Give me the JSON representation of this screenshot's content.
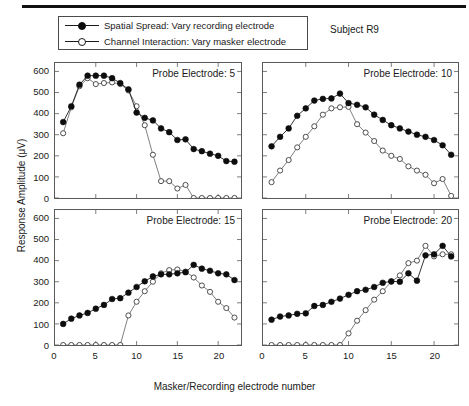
{
  "figure": {
    "subject": "Subject R9",
    "xlabel": "Masker/Recording electrode number",
    "ylabel": "Response Amplitude (μV)"
  },
  "legend": {
    "items": [
      {
        "marker": "filled-circle",
        "label": "Spatial Spread: Vary recording electrode"
      },
      {
        "marker": "open-circle",
        "label": "Channel Interaction: Vary masker electrode"
      }
    ]
  },
  "chart_data": [
    {
      "type": "line",
      "title": "Probe Electrode: 5",
      "panel": "top-left",
      "xlabel": "Masker/Recording electrode number",
      "ylabel": "Response Amplitude (μV)",
      "xlim": [
        0,
        22.8
      ],
      "ylim": [
        0,
        640
      ],
      "xticks": [
        0,
        5,
        10,
        15,
        20
      ],
      "yticks": [
        0,
        100,
        200,
        300,
        400,
        500,
        600
      ],
      "ytick_labels_shown": true,
      "xtick_labels_shown": false,
      "grid": false,
      "x": [
        1,
        2,
        3,
        4,
        5,
        6,
        7,
        8,
        9,
        10,
        11,
        12,
        13,
        14,
        15,
        16,
        17,
        18,
        19,
        20,
        21,
        22
      ],
      "series": [
        {
          "name": "Spatial Spread: Vary recording electrode",
          "marker": "filled-circle",
          "values": [
            360,
            435,
            537,
            580,
            580,
            580,
            568,
            545,
            515,
            405,
            380,
            368,
            330,
            312,
            275,
            278,
            232,
            222,
            210,
            200,
            175,
            172
          ]
        },
        {
          "name": "Channel Interaction: Vary masker electrode",
          "marker": "open-circle",
          "values": [
            307,
            430,
            530,
            568,
            540,
            545,
            548,
            540,
            510,
            435,
            345,
            205,
            80,
            80,
            45,
            62,
            0,
            0,
            0,
            0,
            0,
            0
          ]
        }
      ]
    },
    {
      "type": "line",
      "title": "Probe Electrode: 10",
      "panel": "top-right",
      "xlabel": "Masker/Recording electrode number",
      "ylabel": "Response Amplitude (μV)",
      "xlim": [
        0,
        22.8
      ],
      "ylim": [
        0,
        640
      ],
      "xticks": [
        0,
        5,
        10,
        15,
        20
      ],
      "yticks": [
        0,
        100,
        200,
        300,
        400,
        500,
        600
      ],
      "ytick_labels_shown": false,
      "xtick_labels_shown": false,
      "grid": false,
      "x": [
        1,
        2,
        3,
        4,
        5,
        6,
        7,
        8,
        9,
        10,
        11,
        12,
        13,
        14,
        15,
        16,
        17,
        18,
        19,
        20,
        21,
        22
      ],
      "series": [
        {
          "name": "Spatial Spread: Vary recording electrode",
          "marker": "filled-circle",
          "values": [
            245,
            290,
            330,
            390,
            425,
            462,
            470,
            472,
            495,
            450,
            442,
            430,
            395,
            370,
            345,
            330,
            315,
            300,
            290,
            275,
            250,
            205
          ]
        },
        {
          "name": "Channel Interaction: Vary masker electrode",
          "marker": "open-circle",
          "values": [
            75,
            130,
            180,
            240,
            290,
            340,
            395,
            425,
            430,
            432,
            350,
            310,
            270,
            225,
            200,
            185,
            150,
            130,
            110,
            70,
            90,
            10
          ]
        }
      ]
    },
    {
      "type": "line",
      "title": "Probe Electrode: 15",
      "panel": "bottom-left",
      "xlabel": "Masker/Recording electrode number",
      "ylabel": "Response Amplitude (μV)",
      "xlim": [
        0,
        22.8
      ],
      "ylim": [
        0,
        640
      ],
      "xticks": [
        0,
        5,
        10,
        15,
        20
      ],
      "yticks": [
        0,
        100,
        200,
        300,
        400,
        500,
        600
      ],
      "ytick_labels_shown": true,
      "xtick_labels_shown": true,
      "grid": false,
      "x": [
        1,
        2,
        3,
        4,
        5,
        6,
        7,
        8,
        9,
        10,
        11,
        12,
        13,
        14,
        15,
        16,
        17,
        18,
        19,
        20,
        21,
        22
      ],
      "series": [
        {
          "name": "Spatial Spread: Vary recording electrode",
          "marker": "filled-circle",
          "values": [
            100,
            125,
            140,
            152,
            172,
            190,
            218,
            222,
            248,
            275,
            302,
            325,
            335,
            335,
            340,
            345,
            380,
            362,
            352,
            340,
            335,
            308
          ]
        },
        {
          "name": "Channel Interaction: Vary masker electrode",
          "marker": "open-circle",
          "values": [
            0,
            0,
            0,
            0,
            0,
            0,
            0,
            0,
            140,
            205,
            255,
            300,
            340,
            355,
            358,
            348,
            320,
            282,
            252,
            205,
            175,
            130
          ]
        }
      ]
    },
    {
      "type": "line",
      "title": "Probe Electrode: 20",
      "panel": "bottom-right",
      "xlabel": "Masker/Recording electrode number",
      "ylabel": "Response Amplitude (μV)",
      "xlim": [
        0,
        22.8
      ],
      "ylim": [
        0,
        640
      ],
      "xticks": [
        0,
        5,
        10,
        15,
        20
      ],
      "yticks": [
        0,
        100,
        200,
        300,
        400,
        500,
        600
      ],
      "ytick_labels_shown": false,
      "xtick_labels_shown": true,
      "grid": false,
      "x": [
        1,
        2,
        3,
        4,
        5,
        6,
        7,
        8,
        9,
        10,
        11,
        12,
        13,
        14,
        15,
        16,
        17,
        18,
        19,
        20,
        21,
        22
      ],
      "series": [
        {
          "name": "Spatial Spread: Vary recording electrode",
          "marker": "filled-circle",
          "values": [
            120,
            135,
            140,
            148,
            150,
            185,
            190,
            205,
            220,
            238,
            255,
            262,
            275,
            295,
            302,
            300,
            340,
            305,
            425,
            430,
            470,
            420
          ]
        },
        {
          "name": "Channel Interaction: Vary masker electrode",
          "marker": "open-circle",
          "values": [
            0,
            0,
            0,
            0,
            0,
            0,
            0,
            0,
            0,
            55,
            115,
            165,
            215,
            255,
            300,
            330,
            388,
            400,
            470,
            420,
            430,
            430
          ]
        }
      ]
    }
  ],
  "panels": [
    {
      "id": "top-left",
      "title": "Probe Electrode: 5"
    },
    {
      "id": "top-right",
      "title": "Probe Electrode: 10"
    },
    {
      "id": "bottom-left",
      "title": "Probe Electrode: 15"
    },
    {
      "id": "bottom-right",
      "title": "Probe Electrode: 20"
    }
  ],
  "axes": {
    "ytick_labels": [
      "0",
      "100",
      "200",
      "300",
      "400",
      "500",
      "600"
    ],
    "xtick_labels": [
      "0",
      "5",
      "10",
      "15",
      "20"
    ]
  }
}
